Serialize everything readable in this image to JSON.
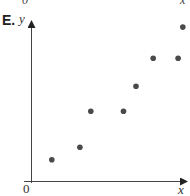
{
  "figure": {
    "panel_label": "E.",
    "top_fragment_left": "0",
    "top_fragment_right": "x",
    "x_axis_label": "x",
    "y_axis_label": "y",
    "origin_label": "0",
    "point_color": "#4a4a4a",
    "axis_color": "#333333"
  },
  "chart_data": {
    "type": "scatter",
    "title": "E.",
    "xlabel": "x",
    "ylabel": "y",
    "grid": false,
    "legend": null,
    "xlim": [
      0,
      10
    ],
    "ylim": [
      0,
      10
    ],
    "ticks": "none (only origin 0 labeled)",
    "points": [
      {
        "x": 1.3,
        "y": 1.4
      },
      {
        "x": 3.1,
        "y": 2.2
      },
      {
        "x": 3.8,
        "y": 4.5
      },
      {
        "x": 5.9,
        "y": 4.5
      },
      {
        "x": 6.7,
        "y": 6.1
      },
      {
        "x": 7.8,
        "y": 7.9
      },
      {
        "x": 9.4,
        "y": 7.9
      },
      {
        "x": 9.7,
        "y": 9.9
      }
    ],
    "annotations": [
      "0 at origin",
      "arrowheads on both axes"
    ]
  }
}
